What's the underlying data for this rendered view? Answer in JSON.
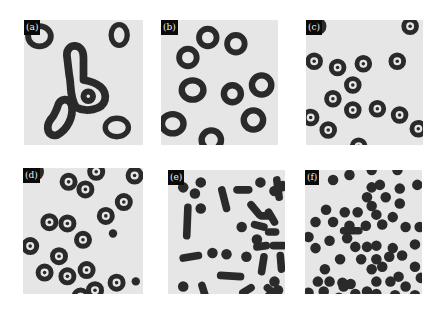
{
  "figure": {
    "panels": [
      {
        "id": "a",
        "label": "(a)",
        "description": "large irregular ring-shaped (annular) domains",
        "rings": [
          {
            "cx": 0.13,
            "cy": 0.13,
            "rx": 0.12,
            "ry": 0.11,
            "inner": 0.55
          },
          {
            "cx": 0.8,
            "cy": 0.12,
            "rx": 0.09,
            "ry": 0.11,
            "inner": 0.5
          },
          {
            "cx": 0.78,
            "cy": 0.86,
            "rx": 0.12,
            "ry": 0.1,
            "inner": 0.55
          }
        ],
        "blobs": [
          {
            "path": "M0.36,0.28 C0.36,0.18 0.50,0.18 0.50,0.30 L0.50,0.48 C0.62,0.50 0.70,0.55 0.68,0.64 C0.66,0.72 0.52,0.74 0.44,0.70 C0.38,0.62 0.40,0.52 0.38,0.44 Z",
            "hole": {
              "cx": 0.54,
              "cy": 0.61,
              "r": 0.04
            }
          },
          {
            "path": "M0.28,0.70 C0.30,0.62 0.38,0.62 0.40,0.68 C0.42,0.78 0.36,0.88 0.28,0.92 C0.20,0.94 0.18,0.86 0.22,0.80 C0.26,0.76 0.26,0.74 0.28,0.70 Z"
          }
        ]
      },
      {
        "id": "b",
        "label": "(b)",
        "description": "medium ring domains",
        "rings": [
          {
            "cx": 0.4,
            "cy": 0.14,
            "rx": 0.1,
            "ry": 0.1,
            "inner": 0.5
          },
          {
            "cx": 0.64,
            "cy": 0.19,
            "rx": 0.1,
            "ry": 0.1,
            "inner": 0.5
          },
          {
            "cx": 0.23,
            "cy": 0.3,
            "rx": 0.1,
            "ry": 0.1,
            "inner": 0.5
          },
          {
            "cx": 0.27,
            "cy": 0.56,
            "rx": 0.12,
            "ry": 0.11,
            "inner": 0.5
          },
          {
            "cx": 0.61,
            "cy": 0.59,
            "rx": 0.1,
            "ry": 0.1,
            "inner": 0.45
          },
          {
            "cx": 0.86,
            "cy": 0.52,
            "rx": 0.11,
            "ry": 0.11,
            "inner": 0.5
          },
          {
            "cx": 0.1,
            "cy": 0.83,
            "rx": 0.12,
            "ry": 0.11,
            "inner": 0.5
          },
          {
            "cx": 0.79,
            "cy": 0.8,
            "rx": 0.11,
            "ry": 0.11,
            "inner": 0.5
          },
          {
            "cx": 0.43,
            "cy": 0.96,
            "rx": 0.11,
            "ry": 0.11,
            "inner": 0.5
          }
        ]
      },
      {
        "id": "c",
        "label": "(c)",
        "description": "small target-like rings",
        "rings": [
          {
            "cx": 0.1,
            "cy": 0.05,
            "r": 0.075
          },
          {
            "cx": 0.89,
            "cy": 0.05,
            "r": 0.075
          },
          {
            "cx": 0.07,
            "cy": 0.33,
            "r": 0.075
          },
          {
            "cx": 0.27,
            "cy": 0.38,
            "r": 0.075
          },
          {
            "cx": 0.49,
            "cy": 0.35,
            "r": 0.075
          },
          {
            "cx": 0.78,
            "cy": 0.33,
            "r": 0.075
          },
          {
            "cx": 0.4,
            "cy": 0.52,
            "r": 0.075
          },
          {
            "cx": 0.23,
            "cy": 0.63,
            "r": 0.075
          },
          {
            "cx": 0.4,
            "cy": 0.72,
            "r": 0.075
          },
          {
            "cx": 0.61,
            "cy": 0.71,
            "r": 0.075
          },
          {
            "cx": 0.8,
            "cy": 0.76,
            "r": 0.075
          },
          {
            "cx": 0.04,
            "cy": 0.78,
            "r": 0.075
          },
          {
            "cx": 0.19,
            "cy": 0.88,
            "r": 0.075
          },
          {
            "cx": 0.96,
            "cy": 0.87,
            "r": 0.075
          },
          {
            "cx": 0.45,
            "cy": 1.01,
            "r": 0.075
          }
        ]
      },
      {
        "id": "d",
        "label": "(d)",
        "description": "target rings plus small dots",
        "rings": [
          {
            "cx": 0.1,
            "cy": 0.03,
            "r": 0.075
          },
          {
            "cx": 0.38,
            "cy": 0.11,
            "r": 0.075
          },
          {
            "cx": 0.61,
            "cy": 0.03,
            "r": 0.075
          },
          {
            "cx": 0.52,
            "cy": 0.17,
            "r": 0.075
          },
          {
            "cx": 0.93,
            "cy": 0.06,
            "r": 0.075
          },
          {
            "cx": 0.84,
            "cy": 0.27,
            "r": 0.075
          },
          {
            "cx": 0.69,
            "cy": 0.38,
            "r": 0.075
          },
          {
            "cx": 0.22,
            "cy": 0.43,
            "r": 0.075
          },
          {
            "cx": 0.37,
            "cy": 0.44,
            "r": 0.075
          },
          {
            "cx": 0.5,
            "cy": 0.57,
            "r": 0.075
          },
          {
            "cx": 0.06,
            "cy": 0.62,
            "r": 0.075
          },
          {
            "cx": 0.3,
            "cy": 0.7,
            "r": 0.075
          },
          {
            "cx": 0.18,
            "cy": 0.83,
            "r": 0.075
          },
          {
            "cx": 0.37,
            "cy": 0.86,
            "r": 0.075
          },
          {
            "cx": 0.53,
            "cy": 0.81,
            "r": 0.075
          },
          {
            "cx": 0.78,
            "cy": 0.91,
            "r": 0.075
          },
          {
            "cx": 0.6,
            "cy": 0.97,
            "r": 0.075
          },
          {
            "cx": 0.48,
            "cy": 1.02,
            "r": 0.075
          }
        ],
        "dots": [
          {
            "cx": 0.75,
            "cy": 0.52,
            "r": 0.035
          },
          {
            "cx": 0.94,
            "cy": 0.9,
            "r": 0.035
          }
        ]
      },
      {
        "id": "e",
        "label": "(e)",
        "description": "mixture of rods and dots",
        "rods": [
          {
            "x1": 0.46,
            "y1": 0.16,
            "x2": 0.5,
            "y2": 0.31
          },
          {
            "x1": 0.59,
            "y1": 0.16,
            "x2": 0.69,
            "y2": 0.16
          },
          {
            "x1": 0.93,
            "y1": 0.08,
            "x2": 0.95,
            "y2": 0.22
          },
          {
            "x1": 0.17,
            "y1": 0.3,
            "x2": 0.16,
            "y2": 0.53
          },
          {
            "x1": 0.71,
            "y1": 0.28,
            "x2": 0.78,
            "y2": 0.36
          },
          {
            "x1": 0.8,
            "y1": 0.37,
            "x2": 0.86,
            "y2": 0.37
          },
          {
            "x1": 0.86,
            "y1": 0.34,
            "x2": 0.91,
            "y2": 0.42
          },
          {
            "x1": 0.74,
            "y1": 0.44,
            "x2": 0.82,
            "y2": 0.46
          },
          {
            "x1": 0.86,
            "y1": 0.5,
            "x2": 0.92,
            "y2": 0.5
          },
          {
            "x1": 0.76,
            "y1": 0.62,
            "x2": 0.84,
            "y2": 0.61
          },
          {
            "x1": 0.9,
            "y1": 0.61,
            "x2": 0.99,
            "y2": 0.61
          },
          {
            "x1": 0.13,
            "y1": 0.71,
            "x2": 0.26,
            "y2": 0.69
          },
          {
            "x1": 0.82,
            "y1": 0.7,
            "x2": 0.8,
            "y2": 0.82
          },
          {
            "x1": 0.96,
            "y1": 0.69,
            "x2": 0.97,
            "y2": 0.8
          },
          {
            "x1": 0.45,
            "y1": 0.85,
            "x2": 0.62,
            "y2": 0.86
          },
          {
            "x1": 0.29,
            "y1": 0.93,
            "x2": 0.32,
            "y2": 1.02
          },
          {
            "x1": 0.64,
            "y1": 0.99,
            "x2": 0.71,
            "y2": 0.95
          },
          {
            "x1": 0.85,
            "y1": 0.95,
            "x2": 0.91,
            "y2": 1.0
          },
          {
            "x1": 0.75,
            "y1": 1.06,
            "x2": 0.75,
            "y2": 1.12
          }
        ],
        "dots": [
          {
            "cx": 0.13,
            "cy": 0.14
          },
          {
            "cx": 0.28,
            "cy": 0.1
          },
          {
            "cx": 0.23,
            "cy": 0.19
          },
          {
            "cx": 0.28,
            "cy": 0.31
          },
          {
            "cx": 0.79,
            "cy": 0.1
          },
          {
            "cx": 0.91,
            "cy": 0.17
          },
          {
            "cx": 0.98,
            "cy": 0.13
          },
          {
            "cx": 0.63,
            "cy": 0.46
          },
          {
            "cx": 0.76,
            "cy": 0.56
          },
          {
            "cx": 0.38,
            "cy": 0.67
          },
          {
            "cx": 0.5,
            "cy": 0.68
          },
          {
            "cx": 0.67,
            "cy": 0.7
          },
          {
            "cx": 0.13,
            "cy": 0.94
          },
          {
            "cx": 0.91,
            "cy": 0.9
          },
          {
            "cx": 0.94,
            "cy": 0.97
          },
          {
            "cx": 0.3,
            "cy": 1.12
          },
          {
            "cx": 0.43,
            "cy": 1.11
          },
          {
            "cx": 0.56,
            "cy": 1.11
          },
          {
            "cx": 0.67,
            "cy": 1.12
          },
          {
            "cx": 0.84,
            "cy": 1.13
          },
          {
            "cx": 0.99,
            "cy": 1.11
          },
          {
            "cx": 0.21,
            "cy": 1.17
          },
          {
            "cx": 0.87,
            "cy": 1.02
          }
        ]
      },
      {
        "id": "f",
        "label": "(f)",
        "description": "dense field of dots",
        "dots": [
          {
            "cx": 0.24,
            "cy": 0.08
          },
          {
            "cx": 0.38,
            "cy": 0.04
          },
          {
            "cx": 0.57,
            "cy": 0.0
          },
          {
            "cx": 0.79,
            "cy": 0.0
          },
          {
            "cx": 0.64,
            "cy": 0.12
          },
          {
            "cx": 0.81,
            "cy": 0.15
          },
          {
            "cx": 0.96,
            "cy": 0.12
          },
          {
            "cx": 0.57,
            "cy": 0.14
          },
          {
            "cx": 0.53,
            "cy": 0.22
          },
          {
            "cx": 0.69,
            "cy": 0.22
          },
          {
            "cx": 0.81,
            "cy": 0.27
          },
          {
            "cx": 0.57,
            "cy": 0.29
          },
          {
            "cx": 0.18,
            "cy": 0.32
          },
          {
            "cx": 0.34,
            "cy": 0.34
          },
          {
            "cx": 0.45,
            "cy": 0.34
          },
          {
            "cx": 0.61,
            "cy": 0.36
          },
          {
            "cx": 0.75,
            "cy": 0.38
          },
          {
            "cx": 0.09,
            "cy": 0.42
          },
          {
            "cx": 0.24,
            "cy": 0.42
          },
          {
            "cx": 0.38,
            "cy": 0.45
          },
          {
            "cx": 0.52,
            "cy": 0.45
          },
          {
            "cx": 0.66,
            "cy": 0.44
          },
          {
            "cx": 0.86,
            "cy": 0.46
          },
          {
            "cx": 0.98,
            "cy": 0.46
          },
          {
            "cx": 0.03,
            "cy": 0.54
          },
          {
            "cx": 0.21,
            "cy": 0.57
          },
          {
            "cx": 0.36,
            "cy": 0.55
          },
          {
            "cx": 0.43,
            "cy": 0.62
          },
          {
            "cx": 0.53,
            "cy": 0.62
          },
          {
            "cx": 0.61,
            "cy": 0.61
          },
          {
            "cx": 0.75,
            "cy": 0.63
          },
          {
            "cx": 0.94,
            "cy": 0.6
          },
          {
            "cx": 0.09,
            "cy": 0.63
          },
          {
            "cx": 0.3,
            "cy": 0.72
          },
          {
            "cx": 0.48,
            "cy": 0.72
          },
          {
            "cx": 0.61,
            "cy": 0.72
          },
          {
            "cx": 0.72,
            "cy": 0.7
          },
          {
            "cx": 0.83,
            "cy": 0.69
          },
          {
            "cx": 0.17,
            "cy": 0.8
          },
          {
            "cx": 0.57,
            "cy": 0.8
          },
          {
            "cx": 0.66,
            "cy": 0.78
          },
          {
            "cx": 0.94,
            "cy": 0.78
          },
          {
            "cx": 0.8,
            "cy": 0.86
          },
          {
            "cx": 0.99,
            "cy": 0.87
          },
          {
            "cx": 0.11,
            "cy": 0.9
          },
          {
            "cx": 0.21,
            "cy": 0.9
          },
          {
            "cx": 0.32,
            "cy": 0.91
          },
          {
            "cx": 0.39,
            "cy": 0.92
          },
          {
            "cx": 0.61,
            "cy": 0.9
          },
          {
            "cx": 0.73,
            "cy": 0.9
          },
          {
            "cx": 0.86,
            "cy": 0.94
          },
          {
            "cx": 0.33,
            "cy": 0.94
          },
          {
            "cx": 0.53,
            "cy": 0.98
          },
          {
            "cx": 0.03,
            "cy": 0.99
          },
          {
            "cx": 0.16,
            "cy": 0.98
          },
          {
            "cx": 0.29,
            "cy": 1.03
          },
          {
            "cx": 0.43,
            "cy": 1.0
          },
          {
            "cx": 0.61,
            "cy": 1.0
          },
          {
            "cx": 0.77,
            "cy": 1.01
          },
          {
            "cx": 0.94,
            "cy": 1.01
          },
          {
            "cx": 0.1,
            "cy": 1.08
          },
          {
            "cx": 0.21,
            "cy": 1.1
          },
          {
            "cx": 0.38,
            "cy": 1.1
          },
          {
            "cx": 0.55,
            "cy": 1.1
          },
          {
            "cx": 0.72,
            "cy": 1.1
          },
          {
            "cx": 0.9,
            "cy": 1.1
          },
          {
            "cx": 0.06,
            "cy": 1.16
          },
          {
            "cx": 0.14,
            "cy": 1.16
          },
          {
            "cx": 0.3,
            "cy": 1.2
          },
          {
            "cx": 0.48,
            "cy": 1.19
          },
          {
            "cx": 0.67,
            "cy": 1.19
          },
          {
            "cx": 0.85,
            "cy": 1.19
          }
        ],
        "rods": [
          {
            "x1": 0.33,
            "y1": 0.49,
            "x2": 0.46,
            "y2": 0.49
          },
          {
            "x1": 0.22,
            "y1": 1.19,
            "x2": 0.3,
            "y2": 1.19
          }
        ]
      }
    ],
    "colors": {
      "background": "#e6e6e6",
      "domain": "#2a2a2a",
      "domain_core": "#e6e6e6",
      "label_bg": "#0a0a0a",
      "label_fg": "#f0f0f0"
    }
  }
}
